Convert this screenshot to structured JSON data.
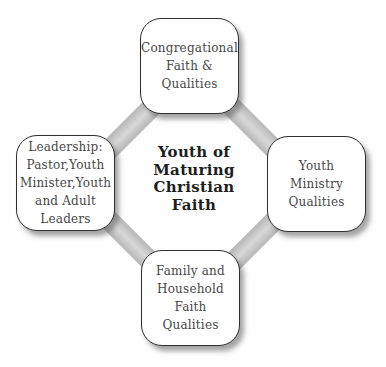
{
  "diagram": {
    "center_title": {
      "lines": [
        "Youth of",
        "Maturing",
        "Christian",
        "Faith"
      ]
    },
    "nodes": [
      {
        "id": "congregational-faith",
        "position": "top",
        "lines": [
          "Congregational",
          "Faith &",
          "Qualities"
        ]
      },
      {
        "id": "leadership",
        "position": "left",
        "lines": [
          "Leadership:",
          "Pastor,Youth",
          "Minister,Youth",
          "and Adult",
          "Leaders"
        ]
      },
      {
        "id": "youth-ministry",
        "position": "right",
        "lines": [
          "Youth",
          "Ministry",
          "Qualities"
        ]
      },
      {
        "id": "family-household",
        "position": "bottom",
        "lines": [
          "Family and",
          "Household",
          "Faith",
          "Qualities"
        ]
      }
    ],
    "connectors": [
      {
        "from": "leadership",
        "to": "congregational-faith"
      },
      {
        "from": "congregational-faith",
        "to": "youth-ministry"
      },
      {
        "from": "leadership",
        "to": "family-household"
      },
      {
        "from": "family-household",
        "to": "youth-ministry"
      }
    ],
    "colors": {
      "band": "#c6c6c6",
      "node_fill": "#ffffff",
      "node_border": "#2f2f2f",
      "node_text": "#474747",
      "center_text": "#1e1e1e",
      "background": "#fefefe"
    }
  }
}
